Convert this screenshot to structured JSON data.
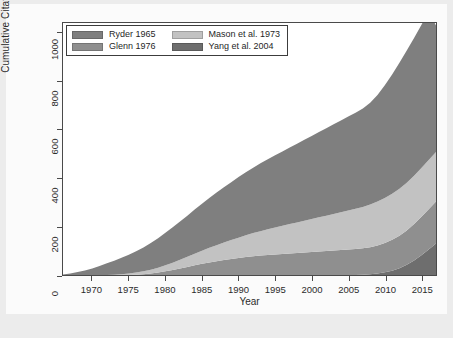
{
  "chart_data": {
    "type": "area",
    "stacked": true,
    "title": "",
    "xlabel": "Year",
    "ylabel": "Cumulative Citations",
    "xlim": [
      1966,
      2017
    ],
    "ylim": [
      0,
      1040
    ],
    "xticks": [
      1970,
      1975,
      1980,
      1985,
      1990,
      1995,
      2000,
      2005,
      2010,
      2015
    ],
    "yticks": [
      0,
      200,
      400,
      600,
      800,
      1000
    ],
    "grid": false,
    "legend_position": "top-left",
    "x": [
      1966,
      1967,
      1968,
      1969,
      1970,
      1971,
      1972,
      1973,
      1974,
      1975,
      1976,
      1977,
      1978,
      1979,
      1980,
      1981,
      1982,
      1983,
      1984,
      1985,
      1986,
      1987,
      1988,
      1989,
      1990,
      1991,
      1992,
      1993,
      1994,
      1995,
      1996,
      1997,
      1998,
      1999,
      2000,
      2001,
      2002,
      2003,
      2004,
      2005,
      2006,
      2007,
      2008,
      2009,
      2010,
      2011,
      2012,
      2013,
      2014,
      2015,
      2016,
      2017
    ],
    "series": [
      {
        "name": "Yang et al. 2004",
        "color": "#6e6e6e",
        "stack_order": 1,
        "values": [
          0,
          0,
          0,
          0,
          0,
          0,
          0,
          0,
          0,
          0,
          0,
          0,
          0,
          0,
          0,
          0,
          0,
          0,
          0,
          0,
          0,
          0,
          0,
          0,
          0,
          0,
          0,
          0,
          0,
          0,
          0,
          0,
          0,
          0,
          0,
          0,
          0,
          0,
          0,
          0,
          0,
          1,
          3,
          6,
          11,
          18,
          28,
          42,
          60,
          82,
          105,
          130
        ]
      },
      {
        "name": "Glenn 1976",
        "color": "#8f8f8f",
        "stack_order": 2,
        "values": [
          0,
          0,
          0,
          0,
          0,
          0,
          0,
          0,
          0,
          0,
          1,
          3,
          6,
          10,
          15,
          21,
          27,
          33,
          40,
          46,
          52,
          57,
          62,
          66,
          70,
          74,
          77,
          80,
          83,
          85,
          87,
          89,
          91,
          93,
          95,
          97,
          99,
          101,
          103,
          105,
          107,
          109,
          112,
          116,
          121,
          127,
          134,
          142,
          150,
          158,
          166,
          173
        ]
      },
      {
        "name": "Mason et al. 1973",
        "color": "#c2c2c2",
        "stack_order": 3,
        "values": [
          0,
          0,
          0,
          0,
          0,
          0,
          0,
          1,
          3,
          6,
          9,
          12,
          16,
          20,
          25,
          30,
          36,
          42,
          48,
          54,
          60,
          66,
          72,
          78,
          84,
          90,
          96,
          101,
          106,
          111,
          116,
          121,
          126,
          131,
          136,
          141,
          146,
          151,
          156,
          161,
          166,
          171,
          176,
          181,
          186,
          190,
          194,
          197,
          200,
          202,
          204,
          205
        ]
      },
      {
        "name": "Ryder 1965",
        "color": "#7f7f7f",
        "stack_order": 4,
        "values": [
          2,
          6,
          12,
          19,
          27,
          37,
          48,
          58,
          68,
          78,
          88,
          99,
          110,
          122,
          134,
          146,
          158,
          170,
          182,
          194,
          206,
          217,
          228,
          239,
          250,
          260,
          270,
          280,
          289,
          298,
          307,
          316,
          325,
          334,
          343,
          352,
          361,
          370,
          379,
          388,
          397,
          406,
          420,
          440,
          465,
          492,
          520,
          545,
          568,
          590,
          610,
          522
        ]
      }
    ],
    "totals_note": "Top of stack reaches approximately 1030 at the final year"
  },
  "legend": {
    "items": [
      {
        "label": "Ryder 1965",
        "color": "#7f7f7f"
      },
      {
        "label": "Mason et al. 1973",
        "color": "#c2c2c2"
      },
      {
        "label": "Glenn 1976",
        "color": "#8f8f8f"
      },
      {
        "label": "Yang et al. 2004",
        "color": "#6e6e6e"
      }
    ]
  },
  "axes": {
    "x_title": "Year",
    "y_title": "Cumulative Citations",
    "x_tick_labels": [
      "1970",
      "1975",
      "1980",
      "1985",
      "1990",
      "1995",
      "2000",
      "2005",
      "2010",
      "2015"
    ],
    "y_tick_labels": [
      "0",
      "200",
      "400",
      "600",
      "800",
      "1000"
    ]
  }
}
